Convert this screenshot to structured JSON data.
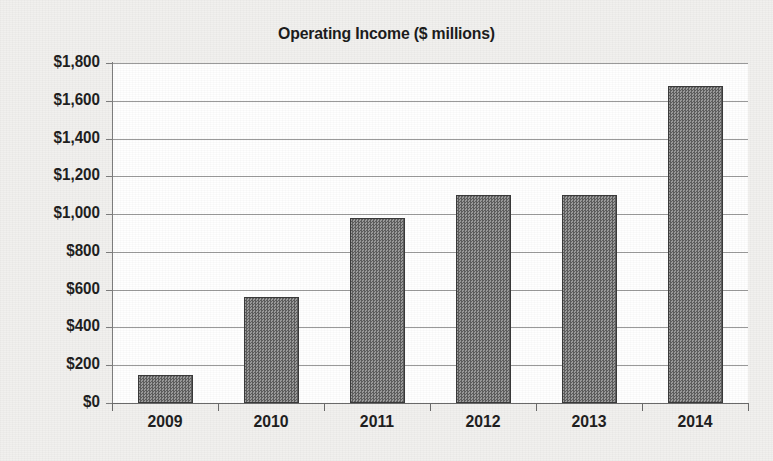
{
  "chart_data": {
    "type": "bar",
    "title": "Operating Income ($ millions)",
    "xlabel": "",
    "ylabel": "",
    "categories": [
      "2009",
      "2010",
      "2011",
      "2012",
      "2013",
      "2014"
    ],
    "values": [
      150,
      560,
      980,
      1100,
      1100,
      1680
    ],
    "series": [
      {
        "name": "Operating Income",
        "values": [
          150,
          560,
          980,
          1100,
          1100,
          1680
        ]
      }
    ],
    "ylim": [
      0,
      1800
    ],
    "ytick_values": [
      0,
      200,
      400,
      600,
      800,
      1000,
      1200,
      1400,
      1600,
      1800
    ],
    "ytick_labels": [
      "$0",
      "$200",
      "$400",
      "$600",
      "$800",
      "$1,000",
      "$1,200",
      "$1,400",
      "$1,600",
      "$1,800"
    ],
    "grid": true,
    "legend": false,
    "legend_position": "none",
    "colors": {
      "bar_fill": "#7c7c7c",
      "bar_border": "#3a3a3a",
      "gridline": "#9a9a9a",
      "axis": "#6a6a6a",
      "plot_background": "#ffffff",
      "page_background": "#f1f0ee",
      "text": "#1f1f1f"
    }
  }
}
